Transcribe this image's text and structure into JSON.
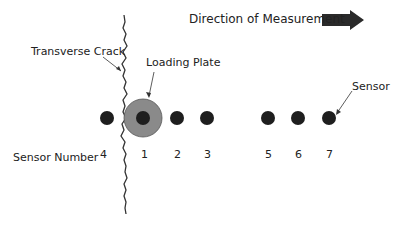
{
  "title": "Direction of Measurement",
  "labels": {
    "crack": "Transverse Crack",
    "plate": "Loading Plate",
    "sensor": "Sensor",
    "sensor_number": "Sensor Number"
  },
  "sensors": [
    {
      "number": "4",
      "x": 107
    },
    {
      "number": "1",
      "x": 143
    },
    {
      "number": "2",
      "x": 177
    },
    {
      "number": "3",
      "x": 207
    },
    {
      "number": "5",
      "x": 268
    },
    {
      "number": "6",
      "x": 298
    },
    {
      "number": "7",
      "x": 329
    }
  ],
  "colors": {
    "sensor": "#1e1e1e",
    "plate": "#8a8a8a",
    "arrow": "#2a2a2a",
    "crack": "#333333"
  }
}
